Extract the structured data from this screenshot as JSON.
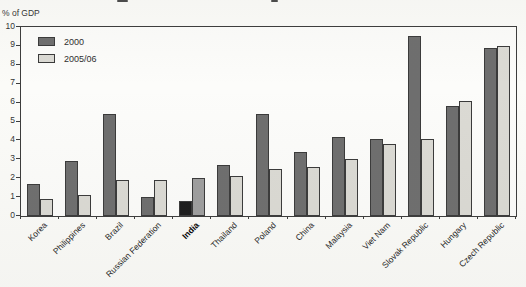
{
  "page": {
    "background": "#fbfbf8",
    "axis_unit_label": "% of GDP"
  },
  "legend": {
    "position": "top-left-inside",
    "items": [
      {
        "label": "2000",
        "color": "#6e6e6e"
      },
      {
        "label": "2005/06",
        "color": "#dbdad4"
      }
    ]
  },
  "chart_data": {
    "type": "bar",
    "title": "",
    "xlabel": "",
    "ylabel": "% of GDP",
    "ylim": [
      0,
      10
    ],
    "yticks": [
      0,
      1,
      2,
      3,
      4,
      5,
      6,
      7,
      8,
      9,
      10
    ],
    "grid": false,
    "legend_position": "top-left-inside",
    "categories": [
      "Korea",
      "Philippines",
      "Brazil",
      "Russian Federation",
      "India",
      "Thailand",
      "Poland",
      "China",
      "Malaysia",
      "Viet Nam",
      "Slovak Republic",
      "Hungary",
      "Czech Republic"
    ],
    "highlight_category": "India",
    "series": [
      {
        "name": "2000",
        "color": "#6e6e6e",
        "highlight_color": "#1c1c1c",
        "values": [
          1.7,
          2.9,
          5.4,
          1.0,
          0.8,
          2.7,
          5.4,
          3.4,
          4.2,
          4.1,
          9.5,
          5.8,
          8.9
        ]
      },
      {
        "name": "2005/06",
        "color": "#dbdad4",
        "highlight_color": "#9e9e9e",
        "values": [
          0.9,
          1.1,
          1.9,
          1.9,
          2.0,
          2.1,
          2.5,
          2.6,
          3.0,
          3.8,
          4.1,
          6.1,
          9.0
        ]
      }
    ],
    "bar_border_color": "#3a3a3a"
  }
}
